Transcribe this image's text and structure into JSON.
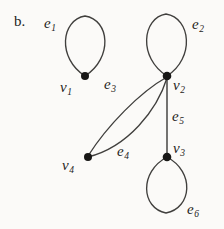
{
  "figure": {
    "part_label": "b.",
    "background_color": "#fbfaf8",
    "ink_color": "#242322"
  },
  "graph": {
    "vertices": [
      {
        "id": "v1",
        "label": "v",
        "subscript": "1",
        "cx": 85,
        "cy": 76,
        "r": 4.0,
        "label_x": 60,
        "label_y": 80
      },
      {
        "id": "v2",
        "label": "v",
        "subscript": "2",
        "cx": 167,
        "cy": 76,
        "r": 4.2,
        "label_x": 173,
        "label_y": 78
      },
      {
        "id": "v3",
        "label": "v",
        "subscript": "3",
        "cx": 167,
        "cy": 157,
        "r": 4.2,
        "label_x": 173,
        "label_y": 141
      },
      {
        "id": "v4",
        "label": "v",
        "subscript": "4",
        "cx": 88,
        "cy": 157,
        "r": 4.0,
        "label_x": 62,
        "label_y": 158
      }
    ],
    "edges": [
      {
        "id": "e1",
        "label": "e",
        "subscript": "1",
        "kind": "loop",
        "at": "v1",
        "label_x": 44,
        "label_y": 16
      },
      {
        "id": "e2",
        "label": "e",
        "subscript": "2",
        "kind": "loop",
        "at": "v2",
        "label_x": 192,
        "label_y": 17
      },
      {
        "id": "e3",
        "label": "e",
        "subscript": "3",
        "kind": "curve",
        "from": "v2",
        "to": "v4",
        "label_x": 104,
        "label_y": 77
      },
      {
        "id": "e4",
        "label": "e",
        "subscript": "4",
        "kind": "curve",
        "from": "v2",
        "to": "v4",
        "label_x": 117,
        "label_y": 144
      },
      {
        "id": "e5",
        "label": "e",
        "subscript": "5",
        "kind": "line",
        "from": "v2",
        "to": "v3",
        "label_x": 172,
        "label_y": 109
      },
      {
        "id": "e6",
        "label": "e",
        "subscript": "6",
        "kind": "loop",
        "at": "v3",
        "label_x": 187,
        "label_y": 202
      }
    ]
  }
}
